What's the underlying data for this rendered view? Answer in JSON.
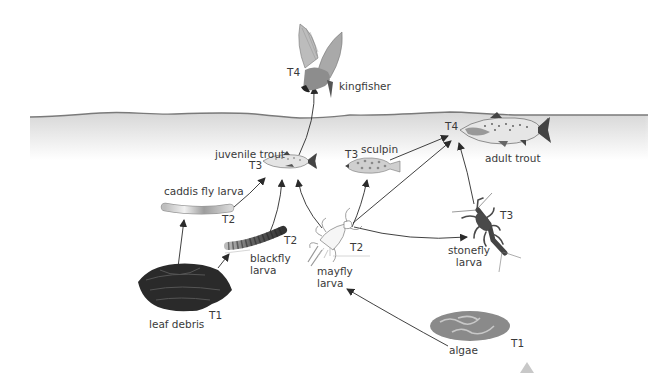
{
  "diagram": {
    "type": "food-web",
    "colors": {
      "water_surface": "#7a7a7a",
      "water_top": "#dcdcdc",
      "arrow": "#2b2b2b",
      "leaf_debris": "#2a2a2a",
      "algae": "#8a8a8a",
      "stonefly": "#4a4a4a"
    },
    "nodes": [
      {
        "id": "kingfisher",
        "label": "kingfisher",
        "trophic": "T4"
      },
      {
        "id": "adult_trout",
        "label": "adult trout",
        "trophic": "T4"
      },
      {
        "id": "juvenile_trout",
        "label": "juvenile trout",
        "trophic": "T3"
      },
      {
        "id": "sculpin",
        "label": "sculpin",
        "trophic": "T3"
      },
      {
        "id": "stonefly_larva",
        "label": "stonefly\nlarva",
        "trophic": "T3"
      },
      {
        "id": "caddis_fly_larva",
        "label": "caddis fly larva",
        "trophic": "T2"
      },
      {
        "id": "blackfly_larva",
        "label": "blackfly\nlarva",
        "trophic": "T2"
      },
      {
        "id": "mayfly_larva",
        "label": "mayfly\nlarva",
        "trophic": "T2"
      },
      {
        "id": "leaf_debris",
        "label": "leaf debris",
        "trophic": "T1"
      },
      {
        "id": "algae",
        "label": "algae",
        "trophic": "T1"
      }
    ],
    "edges": [
      {
        "from": "leaf_debris",
        "to": "caddis_fly_larva"
      },
      {
        "from": "leaf_debris",
        "to": "blackfly_larva"
      },
      {
        "from": "algae",
        "to": "mayfly_larva"
      },
      {
        "from": "caddis_fly_larva",
        "to": "juvenile_trout"
      },
      {
        "from": "blackfly_larva",
        "to": "juvenile_trout"
      },
      {
        "from": "mayfly_larva",
        "to": "juvenile_trout"
      },
      {
        "from": "mayfly_larva",
        "to": "sculpin"
      },
      {
        "from": "mayfly_larva",
        "to": "adult_trout"
      },
      {
        "from": "mayfly_larva",
        "to": "stonefly_larva"
      },
      {
        "from": "sculpin",
        "to": "adult_trout"
      },
      {
        "from": "stonefly_larva",
        "to": "adult_trout"
      },
      {
        "from": "juvenile_trout",
        "to": "kingfisher"
      }
    ]
  },
  "labels": {
    "kingfisher": "kingfisher",
    "kingfisher_t": "T4",
    "adult_trout": "adult trout",
    "adult_trout_t": "T4",
    "juvenile_trout": "juvenile trout",
    "juvenile_trout_t": "T3",
    "sculpin": "sculpin",
    "sculpin_t": "T3",
    "stonefly": "stonefly\nlarva",
    "stonefly_t": "T3",
    "caddis": "caddis fly larva",
    "caddis_t": "T2",
    "blackfly": "blackfly\nlarva",
    "blackfly_t": "T2",
    "mayfly": "mayfly\nlarva",
    "mayfly_t": "T2",
    "leaf": "leaf debris",
    "leaf_t": "T1",
    "algae": "algae",
    "algae_t": "T1"
  }
}
